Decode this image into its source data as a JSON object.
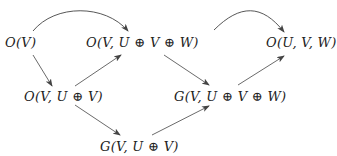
{
  "diagram": {
    "type": "commutative-diagram",
    "nodes": {
      "n1": {
        "label": "O(V)"
      },
      "n2": {
        "label": "O(V, U ⊕ V ⊕ W)"
      },
      "n3": {
        "label": "O(U, V, W)"
      },
      "n4": {
        "label": "O(V, U ⊕ V)"
      },
      "n5": {
        "label": "G(V, U ⊕ V ⊕ W)"
      },
      "n6": {
        "label": "G(V, U ⊕ V)"
      }
    },
    "edges": [
      {
        "from": "O(V)",
        "to": "O(V, U ⊕ V ⊕ W)",
        "style": "curved"
      },
      {
        "from": "O(V, U ⊕ V ⊕ W)",
        "to": "O(U, V, W)",
        "style": "curved"
      },
      {
        "from": "O(V)",
        "to": "O(V, U ⊕ V)",
        "style": "straight"
      },
      {
        "from": "O(V, U ⊕ V)",
        "to": "O(V, U ⊕ V ⊕ W)",
        "style": "straight"
      },
      {
        "from": "O(V, U ⊕ V ⊕ W)",
        "to": "G(V, U ⊕ V ⊕ W)",
        "style": "straight"
      },
      {
        "from": "G(V, U ⊕ V ⊕ W)",
        "to": "O(U, V, W)",
        "style": "straight"
      },
      {
        "from": "O(V, U ⊕ V)",
        "to": "G(V, U ⊕ V)",
        "style": "straight"
      },
      {
        "from": "G(V, U ⊕ V)",
        "to": "G(V, U ⊕ V ⊕ W)",
        "style": "straight"
      }
    ],
    "colors": {
      "text": "#222222",
      "arrow": "#444444",
      "background": "#ffffff"
    }
  }
}
